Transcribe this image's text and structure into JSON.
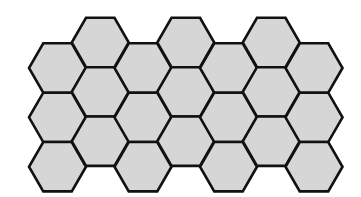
{
  "diagram": {
    "title": "",
    "columns": 7,
    "rows_per_column": 3,
    "total_hexagons": 21,
    "colors": {
      "fill": "#d6d6d6",
      "stroke": "#111111",
      "background": "#ffffff"
    },
    "hexagons": [
      {
        "col": 0,
        "row": 0
      },
      {
        "col": 0,
        "row": 1
      },
      {
        "col": 0,
        "row": 2
      },
      {
        "col": 1,
        "row": 0
      },
      {
        "col": 1,
        "row": 1
      },
      {
        "col": 1,
        "row": 2
      },
      {
        "col": 2,
        "row": 0
      },
      {
        "col": 2,
        "row": 1
      },
      {
        "col": 2,
        "row": 2
      },
      {
        "col": 3,
        "row": 0
      },
      {
        "col": 3,
        "row": 1
      },
      {
        "col": 3,
        "row": 2
      },
      {
        "col": 4,
        "row": 0
      },
      {
        "col": 4,
        "row": 1
      },
      {
        "col": 4,
        "row": 2
      },
      {
        "col": 5,
        "row": 0
      },
      {
        "col": 5,
        "row": 1
      },
      {
        "col": 5,
        "row": 2
      },
      {
        "col": 6,
        "row": 0
      },
      {
        "col": 6,
        "row": 1
      },
      {
        "col": 6,
        "row": 2
      }
    ]
  }
}
